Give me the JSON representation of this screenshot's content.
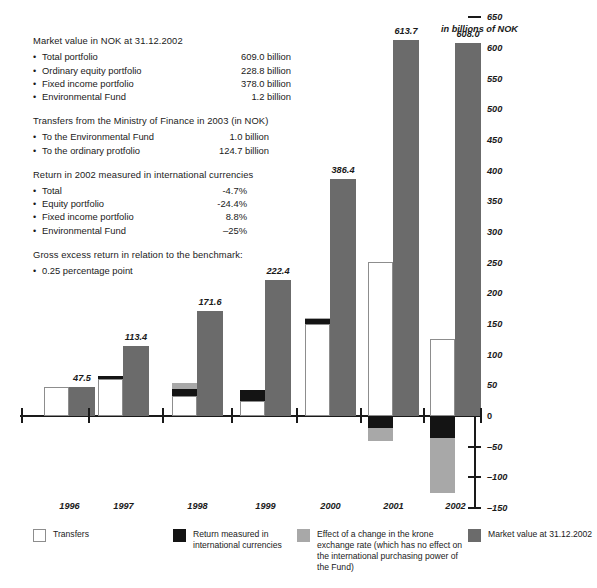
{
  "axis_caption": "in billions of NOK",
  "info": {
    "sections": [
      {
        "heading": "Market value in NOK at 31.12.2002",
        "items": [
          {
            "bullet": "•",
            "label": "Total portfolio",
            "value": "609.0 billion"
          },
          {
            "bullet": "•",
            "label": "Ordinary equity portfolio",
            "value": "228.8 billion"
          },
          {
            "bullet": "•",
            "label": "Fixed income portfolio",
            "value": "378.0 billion"
          },
          {
            "bullet": "•",
            "label": "Environmental Fund",
            "value": "1.2 billion"
          }
        ]
      },
      {
        "heading": "Transfers from the Ministry of Finance in 2003 (in NOK)",
        "items": [
          {
            "bullet": "•",
            "label": "To the Environmental Fund",
            "value": "1.0 billion"
          },
          {
            "bullet": "•",
            "label": "To the ordinary protfolio",
            "value": "124.7 billion"
          }
        ]
      },
      {
        "heading": "Return in 2002 measured in international currencies",
        "items": [
          {
            "bullet": "•",
            "label": "Total",
            "value": "-4.7%"
          },
          {
            "bullet": "•",
            "label": "Equity portfolio",
            "value": "-24.4%"
          },
          {
            "bullet": "•",
            "label": "Fixed income portfolio",
            "value": "8.8%"
          },
          {
            "bullet": "•",
            "label": "Environmental Fund",
            "value": "–25%"
          }
        ]
      },
      {
        "heading": "Gross excess return in relation to the benchmark:",
        "items": [
          {
            "bullet": "•",
            "label": "0.25 percentage point",
            "value": ""
          }
        ]
      }
    ]
  },
  "legend": {
    "items": [
      {
        "key": "tr",
        "label": "Transfers"
      },
      {
        "key": "ret",
        "label": "Return measured in international currencies"
      },
      {
        "key": "kr",
        "label": "Effect of a change in the krone exchange rate (which has no effect on the international purchasing power of the Fund)"
      },
      {
        "key": "mv",
        "label": "Market value at 31.12.2002"
      }
    ]
  },
  "colors": {
    "market_value": "#6b6b6b",
    "return": "#141414",
    "krone_effect": "#a8a8a8",
    "transfers": "#ffffff",
    "axis": "#1a1a1a"
  },
  "chart_data": {
    "type": "bar",
    "title": "",
    "xlabel": "",
    "ylabel": "in billions of NOK",
    "ylim": [
      -150,
      650
    ],
    "yticks": [
      -150,
      -100,
      -50,
      0,
      50,
      100,
      150,
      200,
      250,
      300,
      350,
      400,
      450,
      500,
      550,
      600,
      650
    ],
    "ytick_labels": [
      "–150",
      "–100",
      "–50",
      "0",
      "50",
      "100",
      "150",
      "200",
      "250",
      "300",
      "350",
      "400",
      "450",
      "500",
      "550",
      "600",
      "650"
    ],
    "grid": false,
    "legend_position": "bottom",
    "categories": [
      "1996",
      "1997",
      "1998",
      "1999",
      "2000",
      "2001",
      "2002"
    ],
    "series": [
      {
        "name": "Transfers",
        "values": [
          47.5,
          60.0,
          32.0,
          25.0,
          150.0,
          251.0,
          125.0
        ]
      },
      {
        "name": "Return measured in international currencies",
        "values": [
          0.0,
          6.0,
          12.0,
          18.0,
          8.0,
          -19.0,
          -36.0
        ]
      },
      {
        "name": "Effect of a change in the krone exchange rate",
        "values": [
          0.0,
          0.0,
          9.0,
          0.0,
          2.0,
          -21.0,
          -90.0
        ]
      },
      {
        "name": "Market value at 31.12.2002",
        "values": [
          47.5,
          113.4,
          171.6,
          222.4,
          386.4,
          613.7,
          608.0
        ]
      }
    ],
    "value_labels": [
      "47.5",
      "113.4",
      "171.6",
      "222.4",
      "386.4",
      "613.7",
      "608.0"
    ]
  }
}
